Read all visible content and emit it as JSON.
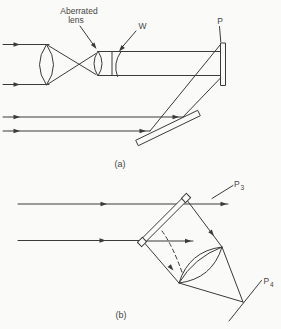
{
  "colors": {
    "ink": "#3a3a3a",
    "paper": "#fafaf8",
    "text": "#454545"
  },
  "figure": {
    "panel_a": {
      "caption": "(a)",
      "aberrated_lens_label_line1": "Aberrated",
      "aberrated_lens_label_line2": "lens",
      "wavefront_label": "W",
      "plate_label": "P"
    },
    "panel_b": {
      "caption": "(b)",
      "p3_label_base": "P",
      "p3_label_sub": "3",
      "p4_label_base": "P",
      "p4_label_sub": "4"
    }
  }
}
